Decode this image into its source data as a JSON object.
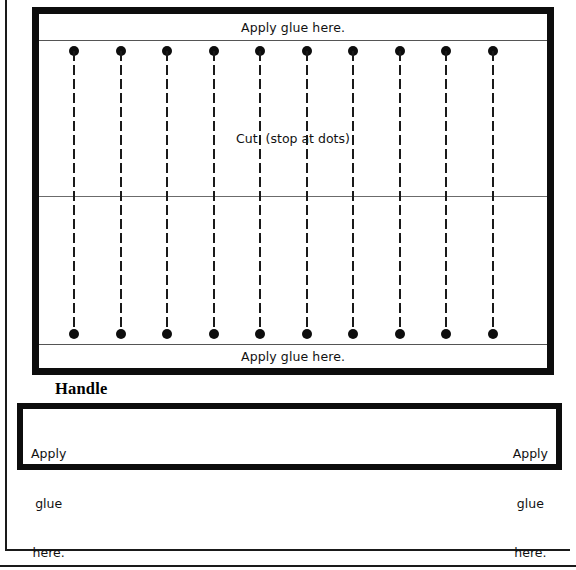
{
  "document": {
    "title": "Paper fan craft template",
    "description": "Printable fold-and-glue fan pattern with pleat cut lines and a handle strip."
  },
  "fan_body": {
    "top_glue_label": "Apply glue here.",
    "bottom_glue_label": "Apply glue here.",
    "cut_instruction": "Cut. (stop at dots)",
    "pleat_count": 10,
    "pleat_x_positions": [
      74,
      121,
      167,
      214,
      260,
      307,
      353,
      400,
      446,
      493
    ],
    "dot_color": "#0d0d0d",
    "border_color": "#0d0d0d",
    "rule_color": "#6b6b6b"
  },
  "handle": {
    "caption": "Handle",
    "left_glue": {
      "line1": "Apply",
      "line2": "glue",
      "line3": "here."
    },
    "right_glue": {
      "line1": "Apply",
      "line2": "glue",
      "line3": "here."
    },
    "border_color": "#0d0d0d"
  },
  "page_frame": {
    "border_color": "#1a1a1a"
  }
}
